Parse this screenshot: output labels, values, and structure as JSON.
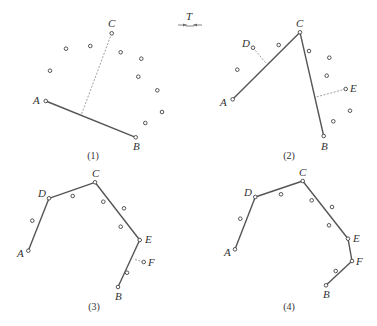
{
  "tolerance_symbol": {
    "label": "T",
    "x": 190,
    "y": 20
  },
  "panels": [
    {
      "caption": "(1)",
      "caption_pos": [
        93,
        159
      ],
      "named_points": [
        {
          "name": "A",
          "x": 45.7,
          "y": 101,
          "lx": 33,
          "ly": 104
        },
        {
          "name": "B",
          "x": 135.7,
          "y": 137.3,
          "lx": 133,
          "ly": 150
        },
        {
          "name": "C",
          "x": 111.7,
          "y": 33.3,
          "lx": 108,
          "ly": 27
        }
      ],
      "dots": [
        [
          66,
          48.7
        ],
        [
          90.3,
          46
        ],
        [
          120.7,
          52.3
        ],
        [
          141.3,
          58.7
        ],
        [
          138.3,
          76.7
        ],
        [
          50,
          70.7
        ],
        [
          157.3,
          90.3
        ],
        [
          162,
          112
        ],
        [
          145.3,
          123
        ]
      ],
      "segments": [
        [
          [
            45.7,
            101
          ],
          [
            135.7,
            137.3
          ]
        ]
      ],
      "dashes": [
        [
          [
            111.7,
            33.3
          ],
          [
            81,
            115.7
          ]
        ]
      ]
    },
    {
      "caption": "(2)",
      "caption_pos": [
        289,
        159
      ],
      "named_points": [
        {
          "name": "A",
          "x": 232.7,
          "y": 99.3,
          "lx": 220,
          "ly": 106
        },
        {
          "name": "B",
          "x": 323.7,
          "y": 136,
          "lx": 321,
          "ly": 150
        },
        {
          "name": "C",
          "x": 300,
          "y": 32.3,
          "lx": 296,
          "ly": 27
        },
        {
          "name": "D",
          "x": 253,
          "y": 47.7,
          "lx": 242,
          "ly": 47
        },
        {
          "name": "E",
          "x": 345.7,
          "y": 89,
          "lx": 350,
          "ly": 92
        }
      ],
      "dots": [
        [
          278.7,
          45
        ],
        [
          237.3,
          69.7
        ],
        [
          309,
          51
        ],
        [
          329.3,
          57.7
        ],
        [
          326.7,
          75.7
        ],
        [
          350,
          110.7
        ],
        [
          333.3,
          121.3
        ]
      ],
      "segments": [
        [
          [
            232.7,
            99.3
          ],
          [
            300,
            32.3
          ]
        ],
        [
          [
            300,
            32.3
          ],
          [
            323.7,
            136
          ]
        ]
      ],
      "dashes": [
        [
          [
            253,
            47.7
          ],
          [
            265.7,
            62.7
          ]
        ],
        [
          [
            345.7,
            89
          ],
          [
            315,
            97.3
          ]
        ]
      ]
    },
    {
      "caption": "(3)",
      "caption_pos": [
        94,
        310
      ],
      "named_points": [
        {
          "name": "A",
          "x": 28.3,
          "y": 250.7,
          "lx": 17,
          "ly": 257
        },
        {
          "name": "B",
          "x": 118,
          "y": 287,
          "lx": 115,
          "ly": 300
        },
        {
          "name": "C",
          "x": 95,
          "y": 182.3,
          "lx": 92,
          "ly": 177
        },
        {
          "name": "D",
          "x": 49,
          "y": 198.3,
          "lx": 38,
          "ly": 197
        },
        {
          "name": "E",
          "x": 139.7,
          "y": 240,
          "lx": 145,
          "ly": 243
        },
        {
          "name": "F",
          "x": 143.7,
          "y": 262,
          "lx": 148,
          "ly": 266
        }
      ],
      "dots": [
        [
          72.7,
          196
        ],
        [
          32.3,
          220.7
        ],
        [
          103.3,
          201.7
        ],
        [
          124,
          208.3
        ],
        [
          120.7,
          226.7
        ],
        [
          127,
          272.7
        ]
      ],
      "segments": [
        [
          [
            28.3,
            250.7
          ],
          [
            49,
            198.3
          ]
        ],
        [
          [
            49,
            198.3
          ],
          [
            95,
            182.3
          ]
        ],
        [
          [
            95,
            182.3
          ],
          [
            139.7,
            240
          ]
        ],
        [
          [
            139.7,
            240
          ],
          [
            118,
            287
          ]
        ]
      ],
      "dashes": [
        [
          [
            143.7,
            262
          ],
          [
            133.3,
            259
          ]
        ]
      ]
    },
    {
      "caption": "(4)",
      "caption_pos": [
        289,
        310
      ],
      "named_points": [
        {
          "name": "A",
          "x": 235,
          "y": 249.3,
          "lx": 224,
          "ly": 256
        },
        {
          "name": "B",
          "x": 326,
          "y": 285.3,
          "lx": 323,
          "ly": 298
        },
        {
          "name": "C",
          "x": 302.7,
          "y": 181,
          "lx": 299,
          "ly": 176
        },
        {
          "name": "D",
          "x": 255.3,
          "y": 197,
          "lx": 244,
          "ly": 196
        },
        {
          "name": "E",
          "x": 348,
          "y": 238.7,
          "lx": 353,
          "ly": 242
        },
        {
          "name": "F",
          "x": 352,
          "y": 261,
          "lx": 356,
          "ly": 265
        }
      ],
      "dots": [
        [
          281,
          194.3
        ],
        [
          240.3,
          218.7
        ],
        [
          311.7,
          200.3
        ],
        [
          332,
          207
        ],
        [
          329,
          225.3
        ],
        [
          335.7,
          271
        ]
      ],
      "segments": [
        [
          [
            235,
            249.3
          ],
          [
            255.3,
            197
          ]
        ],
        [
          [
            255.3,
            197
          ],
          [
            302.7,
            181
          ]
        ],
        [
          [
            302.7,
            181
          ],
          [
            348,
            238.7
          ]
        ],
        [
          [
            348,
            238.7
          ],
          [
            352,
            261
          ]
        ],
        [
          [
            352,
            261
          ],
          [
            326,
            285.3
          ]
        ]
      ],
      "dashes": []
    }
  ]
}
